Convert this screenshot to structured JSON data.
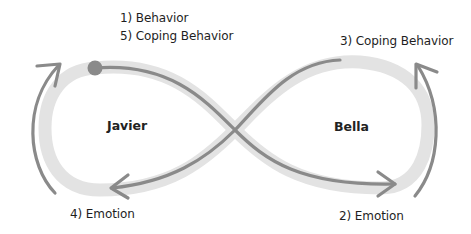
{
  "diagram": {
    "participants": [
      {
        "name": "Javier"
      },
      {
        "name": "Bella"
      }
    ],
    "steps": [
      {
        "label": "1) Behavior"
      },
      {
        "label": "5) Coping Behavior"
      },
      {
        "label": "3) Coping Behavior"
      },
      {
        "label": "4) Emotion"
      },
      {
        "label": "2) Emotion"
      }
    ],
    "colors": {
      "track": "#e3e3e3",
      "path": "#8a8a8a",
      "start_dot": "#8a8a8a",
      "text": "#1e1e1e"
    }
  }
}
